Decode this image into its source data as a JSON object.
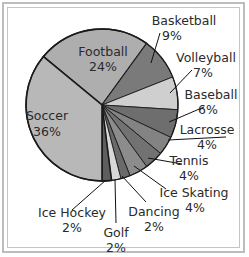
{
  "chart_data": {
    "type": "pie",
    "title": "",
    "slices": [
      {
        "label": "Football",
        "pct_label": "24%",
        "value": 24,
        "color": "#aeaeae"
      },
      {
        "label": "Basketball",
        "pct_label": "9%",
        "value": 9,
        "color": "#7a7a7a"
      },
      {
        "label": "Volleyball",
        "pct_label": "7%",
        "value": 7,
        "color": "#cfcfcf"
      },
      {
        "label": "Baseball",
        "pct_label": "6%",
        "value": 6,
        "color": "#6e6e6e"
      },
      {
        "label": "Lacrosse",
        "pct_label": "4%",
        "value": 4,
        "color": "#838383"
      },
      {
        "label": "Tennis",
        "pct_label": "4%",
        "value": 4,
        "color": "#727272"
      },
      {
        "label": "Ice Skating",
        "pct_label": "4%",
        "value": 4,
        "color": "#8c8c8c"
      },
      {
        "label": "Dancing",
        "pct_label": "2%",
        "value": 2,
        "color": "#6a6a6a"
      },
      {
        "label": "Golf",
        "pct_label": "2%",
        "value": 2,
        "color": "#d8d8d8"
      },
      {
        "label": "Ice Hockey",
        "pct_label": "2%",
        "value": 2,
        "color": "#5e5e5e"
      },
      {
        "label": "Soccer",
        "pct_label": "36%",
        "value": 36,
        "color": "#b8b8b8"
      }
    ]
  }
}
